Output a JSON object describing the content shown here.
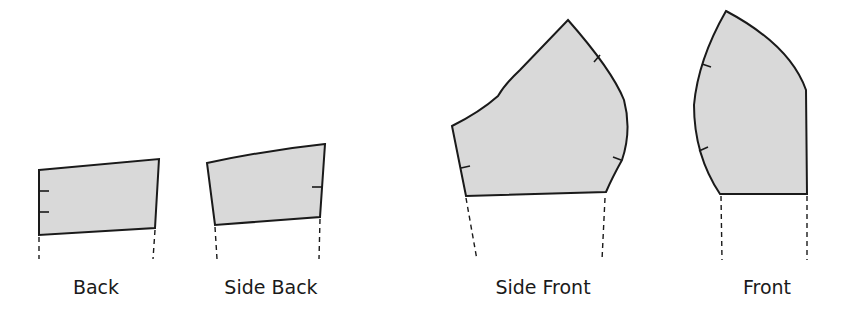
{
  "diagram": {
    "type": "sewing-pattern-pieces",
    "colors": {
      "fill": "#d9d9d9",
      "stroke": "#1a1a1a",
      "background": "#ffffff"
    },
    "pieces": [
      {
        "id": "back",
        "label": "Back",
        "notches": 2,
        "label_x": 96
      },
      {
        "id": "side-back",
        "label": "Side Back",
        "notches": 1,
        "label_x": 268
      },
      {
        "id": "side-front",
        "label": "Side Front",
        "notches": 3,
        "label_x": 541
      },
      {
        "id": "front",
        "label": "Front",
        "notches": 2,
        "label_x": 767
      }
    ]
  }
}
